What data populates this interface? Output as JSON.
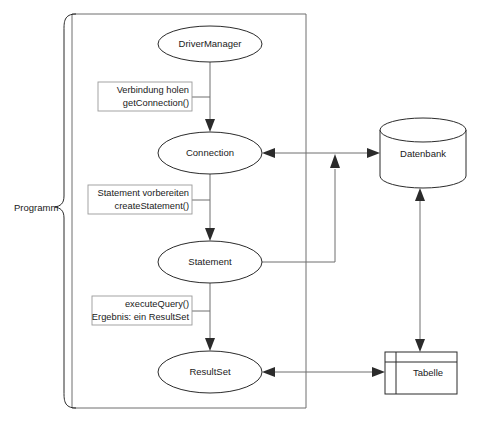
{
  "diagram": {
    "language": "de",
    "bracket": {
      "label": "Programm"
    },
    "nodes": [
      {
        "id": "drivermanager",
        "label": "DriverManager",
        "shape": "ellipse",
        "cx": 210,
        "cy": 44,
        "rx": 52,
        "ry": 18
      },
      {
        "id": "connection",
        "label": "Connection",
        "shape": "ellipse",
        "cx": 210,
        "cy": 153,
        "rx": 52,
        "ry": 21
      },
      {
        "id": "statement",
        "label": "Statement",
        "shape": "ellipse",
        "cx": 210,
        "cy": 262,
        "rx": 52,
        "ry": 21
      },
      {
        "id": "resultset",
        "label": "ResultSet",
        "shape": "ellipse",
        "cx": 210,
        "cy": 372,
        "rx": 52,
        "ry": 21
      },
      {
        "id": "datenbank",
        "label": "Datenbank",
        "shape": "cylinder",
        "x": 380,
        "y": 118,
        "w": 86,
        "h": 70
      },
      {
        "id": "tabelle",
        "label": "Tabelle",
        "shape": "table",
        "x": 385,
        "y": 352,
        "w": 72,
        "h": 42
      }
    ],
    "edge_labels": [
      {
        "id": "get-connection",
        "line1": "Verbindung holen",
        "line2": "getConnection()"
      },
      {
        "id": "create-statement",
        "line1": "Statement vorbereiten",
        "line2": "createStatement()"
      },
      {
        "id": "execute-query",
        "line1": "executeQuery()",
        "line2": "Ergebnis: ein ResultSet"
      }
    ],
    "colors": {
      "stroke": "#2b2b2b",
      "thin_stroke": "#6e6e6e",
      "label_border": "#9a9a9a",
      "background": "#ffffff",
      "text": "#1a1a1a"
    }
  }
}
